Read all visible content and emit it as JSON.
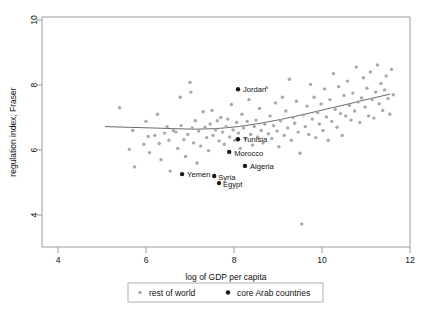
{
  "chart_data": {
    "type": "scatter",
    "title": "",
    "xlabel": "log of GDP per capita",
    "ylabel": "regulation index, Fraser",
    "xlim": [
      4,
      12
    ],
    "ylim": [
      3.3,
      10.2
    ],
    "xticks": [
      4,
      6,
      8,
      10,
      12
    ],
    "yticks": [
      4,
      6,
      8,
      10
    ],
    "grid": false,
    "legend_position": "below",
    "legend": [
      {
        "name": "rest of world",
        "color": "#a8a8a8",
        "marker": "small-dot"
      },
      {
        "name": "core Arab countries",
        "color": "#1a1a1a",
        "marker": "dot"
      }
    ],
    "series": [
      {
        "name": "rest of world",
        "color": "#a8a8a8",
        "points": [
          [
            5.4,
            7.3
          ],
          [
            5.62,
            6.02
          ],
          [
            5.7,
            6.6
          ],
          [
            5.74,
            5.48
          ],
          [
            5.95,
            6.18
          ],
          [
            6.0,
            6.88
          ],
          [
            6.05,
            6.42
          ],
          [
            6.08,
            5.92
          ],
          [
            6.2,
            6.45
          ],
          [
            6.26,
            7.1
          ],
          [
            6.3,
            6.2
          ],
          [
            6.34,
            5.7
          ],
          [
            6.42,
            6.52
          ],
          [
            6.48,
            6.72
          ],
          [
            6.52,
            6.3
          ],
          [
            6.55,
            5.35
          ],
          [
            6.62,
            6.6
          ],
          [
            6.68,
            6.55
          ],
          [
            6.72,
            6.05
          ],
          [
            6.78,
            7.62
          ],
          [
            6.8,
            6.75
          ],
          [
            6.86,
            6.32
          ],
          [
            6.9,
            5.8
          ],
          [
            6.95,
            6.48
          ],
          [
            7.0,
            8.08
          ],
          [
            7.02,
            7.78
          ],
          [
            7.05,
            6.68
          ],
          [
            7.08,
            6.22
          ],
          [
            7.12,
            6.9
          ],
          [
            7.16,
            5.6
          ],
          [
            7.2,
            6.58
          ],
          [
            7.24,
            6.12
          ],
          [
            7.3,
            7.18
          ],
          [
            7.34,
            6.7
          ],
          [
            7.38,
            6.38
          ],
          [
            7.42,
            5.98
          ],
          [
            7.46,
            6.8
          ],
          [
            7.5,
            7.22
          ],
          [
            7.52,
            6.45
          ],
          [
            7.58,
            6.62
          ],
          [
            7.62,
            6.9
          ],
          [
            7.66,
            6.28
          ],
          [
            7.7,
            7.0
          ],
          [
            7.74,
            6.55
          ],
          [
            7.78,
            6.18
          ],
          [
            7.82,
            6.72
          ],
          [
            7.86,
            6.95
          ],
          [
            7.9,
            6.4
          ],
          [
            7.94,
            7.4
          ],
          [
            7.98,
            6.62
          ],
          [
            8.02,
            6.3
          ],
          [
            8.06,
            6.85
          ],
          [
            8.1,
            6.52
          ],
          [
            8.14,
            6.05
          ],
          [
            8.18,
            7.1
          ],
          [
            8.22,
            6.68
          ],
          [
            8.26,
            6.35
          ],
          [
            8.3,
            6.88
          ],
          [
            8.34,
            7.55
          ],
          [
            8.38,
            6.48
          ],
          [
            8.42,
            6.15
          ],
          [
            8.46,
            6.72
          ],
          [
            8.5,
            6.92
          ],
          [
            8.54,
            6.4
          ],
          [
            8.58,
            7.28
          ],
          [
            8.62,
            6.6
          ],
          [
            8.66,
            6.22
          ],
          [
            8.7,
            6.8
          ],
          [
            8.74,
            7.92
          ],
          [
            8.78,
            6.5
          ],
          [
            8.82,
            7.05
          ],
          [
            8.86,
            6.35
          ],
          [
            8.9,
            6.75
          ],
          [
            8.94,
            7.45
          ],
          [
            8.98,
            6.58
          ],
          [
            9.02,
            6.1
          ],
          [
            9.06,
            6.9
          ],
          [
            9.1,
            7.62
          ],
          [
            9.14,
            6.45
          ],
          [
            9.18,
            7.2
          ],
          [
            9.22,
            6.68
          ],
          [
            9.26,
            8.18
          ],
          [
            9.3,
            6.3
          ],
          [
            9.34,
            7.0
          ],
          [
            9.38,
            6.82
          ],
          [
            9.42,
            7.5
          ],
          [
            9.46,
            6.55
          ],
          [
            9.5,
            5.9
          ],
          [
            9.54,
            3.72
          ],
          [
            9.58,
            7.08
          ],
          [
            9.62,
            6.72
          ],
          [
            9.66,
            7.35
          ],
          [
            9.7,
            6.48
          ],
          [
            9.74,
            8.02
          ],
          [
            9.78,
            6.95
          ],
          [
            9.82,
            7.62
          ],
          [
            9.86,
            6.38
          ],
          [
            9.9,
            7.15
          ],
          [
            9.94,
            6.8
          ],
          [
            9.98,
            7.42
          ],
          [
            10.02,
            6.6
          ],
          [
            10.06,
            7.88
          ],
          [
            10.1,
            7.02
          ],
          [
            10.14,
            6.3
          ],
          [
            10.18,
            7.55
          ],
          [
            10.22,
            6.88
          ],
          [
            10.26,
            8.35
          ],
          [
            10.3,
            7.25
          ],
          [
            10.34,
            6.7
          ],
          [
            10.38,
            7.95
          ],
          [
            10.42,
            7.12
          ],
          [
            10.46,
            6.45
          ],
          [
            10.5,
            7.68
          ],
          [
            10.54,
            7.05
          ],
          [
            10.58,
            8.12
          ],
          [
            10.62,
            7.38
          ],
          [
            10.66,
            6.92
          ],
          [
            10.7,
            7.75
          ],
          [
            10.74,
            7.2
          ],
          [
            10.78,
            8.55
          ],
          [
            10.82,
            7.48
          ],
          [
            10.86,
            6.85
          ],
          [
            10.9,
            7.6
          ],
          [
            10.94,
            8.22
          ],
          [
            10.98,
            7.32
          ],
          [
            11.02,
            7.9
          ],
          [
            11.06,
            7.05
          ],
          [
            11.1,
            8.4
          ],
          [
            11.14,
            7.55
          ],
          [
            11.18,
            6.98
          ],
          [
            11.22,
            7.78
          ],
          [
            11.26,
            8.62
          ],
          [
            11.3,
            7.42
          ],
          [
            11.34,
            8.05
          ],
          [
            11.38,
            7.22
          ],
          [
            11.42,
            7.85
          ],
          [
            11.46,
            8.28
          ],
          [
            11.5,
            7.58
          ],
          [
            11.54,
            7.1
          ],
          [
            11.58,
            8.48
          ],
          [
            11.62,
            7.7
          ]
        ]
      },
      {
        "name": "core Arab countries",
        "color": "#1a1a1a",
        "points": [
          {
            "label": "Jordan",
            "x": 8.09,
            "y": 7.87,
            "label_dx": 5,
            "label_dy": 3
          },
          {
            "label": "Tunisia",
            "x": 8.09,
            "y": 6.33,
            "label_dx": 5,
            "label_dy": 3
          },
          {
            "label": "Morocco",
            "x": 7.89,
            "y": 5.94,
            "label_dx": 5,
            "label_dy": 4
          },
          {
            "label": "Algeria",
            "x": 8.25,
            "y": 5.51,
            "label_dx": 5,
            "label_dy": 3
          },
          {
            "label": "Yemen",
            "x": 6.82,
            "y": 5.26,
            "label_dx": 5,
            "label_dy": 3
          },
          {
            "label": "Syria",
            "x": 7.55,
            "y": 5.2,
            "label_dx": 4,
            "label_dy": 4
          },
          {
            "label": "Egypt",
            "x": 7.66,
            "y": 4.98,
            "label_dx": 4,
            "label_dy": 4
          }
        ]
      }
    ],
    "trendline": {
      "name": "lowess smooth",
      "color": "#6b6b6b",
      "points": [
        [
          5.07,
          6.72
        ],
        [
          5.6,
          6.7
        ],
        [
          6.1,
          6.68
        ],
        [
          6.6,
          6.66
        ],
        [
          7.1,
          6.64
        ],
        [
          7.6,
          6.66
        ],
        [
          8.1,
          6.72
        ],
        [
          8.6,
          6.82
        ],
        [
          9.1,
          6.95
        ],
        [
          9.6,
          7.1
        ],
        [
          10.1,
          7.26
        ],
        [
          10.6,
          7.42
        ],
        [
          11.1,
          7.58
        ],
        [
          11.55,
          7.72
        ]
      ]
    }
  }
}
